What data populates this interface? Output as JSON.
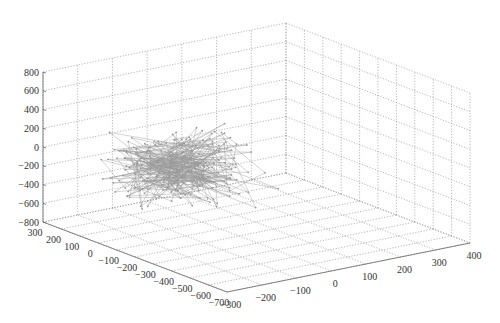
{
  "chart_data": {
    "type": "line3d",
    "title": "",
    "xlabel": "",
    "ylabel": "",
    "zlabel": "",
    "x_axis": {
      "range": [
        -700,
        300
      ],
      "ticks": [
        300,
        200,
        100,
        0,
        -100,
        -200,
        -300,
        -400,
        -500,
        -600,
        -700
      ]
    },
    "y_axis": {
      "range": [
        -300,
        400
      ],
      "ticks": [
        -300,
        -200,
        -100,
        0,
        100,
        200,
        300,
        400
      ]
    },
    "z_axis": {
      "range": [
        -800,
        800
      ],
      "ticks": [
        800,
        600,
        400,
        200,
        0,
        -200,
        -400,
        -600,
        -800
      ]
    },
    "grid": true,
    "legend": null,
    "series": [
      {
        "name": "random walk trajectory",
        "style": "gray line with point markers",
        "color": "#9a9a9a",
        "description": "Dense tangled 3D trajectory of ~300 points clustered near x≈-150, y≈-150, z≈0, spread roughly z in [-500, 700]",
        "center": {
          "x": -150,
          "y": -150,
          "z": 0
        },
        "spread": {
          "x": 200,
          "y": 130,
          "z": 220
        },
        "n_points": 300
      }
    ]
  },
  "labels": {
    "z_ticks": [
      "800",
      "600",
      "400",
      "200",
      "0",
      "−200",
      "−400",
      "−600",
      "−800"
    ],
    "x_ticks": [
      "300",
      "200",
      "100",
      "0",
      "−100",
      "−200",
      "−300",
      "−400",
      "−500",
      "−600",
      "−700"
    ],
    "y_ticks": [
      "−300",
      "−200",
      "−100",
      "0",
      "100",
      "200",
      "300",
      "400"
    ]
  }
}
